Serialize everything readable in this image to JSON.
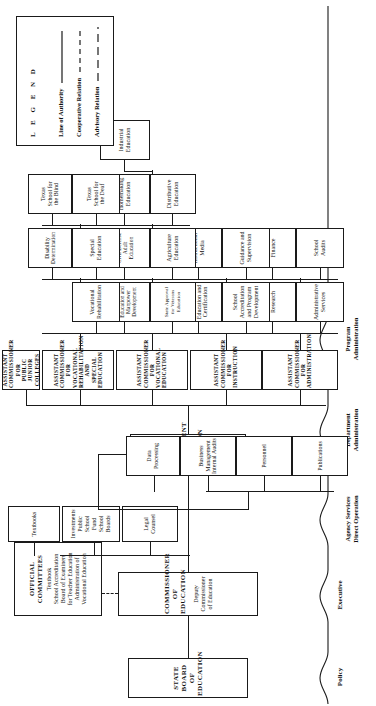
{
  "chart_title": "State Department of Education Organization Chart",
  "boxes": {
    "state_board": "STATE BOARD OF EDUCATION",
    "commissioner_line1": "COMMISSIONER",
    "commissioner_line2": "OF EDUCATION",
    "commissioner_sub": "Deputy Commissioner of Education",
    "official_committees_title": "OFFICIAL COMMITTEES",
    "official_committees_items": [
      "Textbook",
      "School Accreditation",
      "Board of Examiners",
      "for Teacher Education",
      "Administration of",
      "Vocational Education"
    ],
    "legal_counsel": "Legal\nCounsel",
    "investments": "Investments\nPublic School\nFund\nSchool Boards",
    "textbooks": "Textbooks",
    "state_department_line1": "STATE DEPARTMENT",
    "state_department_line2": "OF EDUCATION",
    "publications": "Publications",
    "personnel": "Personnel",
    "business_mgmt": "Business\nManagement\nInternal Audits",
    "data_processing": "Data\nProcessing",
    "ac_administration": "ASSISTANT COMMISSIONER\nFOR ADMINISTRATION",
    "ac_instruction": "ASSISTANT COMMISSIONER\nFOR INSTRUCTION",
    "ac_vocational": "ASSISTANT COMMISSIONER\nFOR VOCATIONAL EDUCATION",
    "ac_vocrehab": "ASSISTANT COMMISSIONER FOR\nVOCATIONAL REHABILITATION\nAND SPECIAL EDUCATION",
    "ac_junior_colleges": "ASSISTANT COMMISSIONER FOR\nPUBLIC JUNIOR COLLEGES",
    "administrative_services": "Administrative\nServices",
    "research": "Research",
    "school_audits": "School\nAudits",
    "finance": "Finance",
    "school_accreditation": "School\nAccreditation\nand Program\nDevelopment",
    "guidance": "Guidance and\nSupervision",
    "teacher_education": "Teacher\nEducation and\nCertification",
    "instructional_media": "Instructional\nMedia",
    "state_approval": "State Approval\nfor Veterans\nEducation",
    "agriculture_education": "Agriculture\nEducation",
    "technical_education": "Technical\nEducation and\nManpower\nDevelopment",
    "distributive_education": "Distributive\nEducation",
    "civil_defense": "Civil Defense\nAdult\nEducation",
    "homemaking_education": "Homemaking\nEducation",
    "industrial_education": "Industrial\nEducation",
    "vocational_rehabilitation": "Vocational\nRehabilitation",
    "special_education": "Special\nEducation",
    "disability_determination": "Disability\nDetermination",
    "texas_school_deaf": "Texas\nSchool for\nthe Deaf",
    "texas_school_blind": "Texas\nSchool for\nthe Blind"
  },
  "side_categories": [
    {
      "label": "Policy"
    },
    {
      "label": "Executive"
    },
    {
      "label": "Agency Services\nDirect Operation"
    },
    {
      "label": "Department\nAdministration"
    },
    {
      "label": "Program\nAdministration"
    }
  ],
  "legend": {
    "title": "L E G E N D",
    "rows": [
      {
        "label": "Line of Authority",
        "style": "solid"
      },
      {
        "label": "Cooperative Relation",
        "style": "dashed"
      },
      {
        "label": "Advisory Relation",
        "style": "dashed-long"
      }
    ]
  },
  "colors": {
    "ink": "#1a1a1a",
    "paper": "#ffffff"
  }
}
